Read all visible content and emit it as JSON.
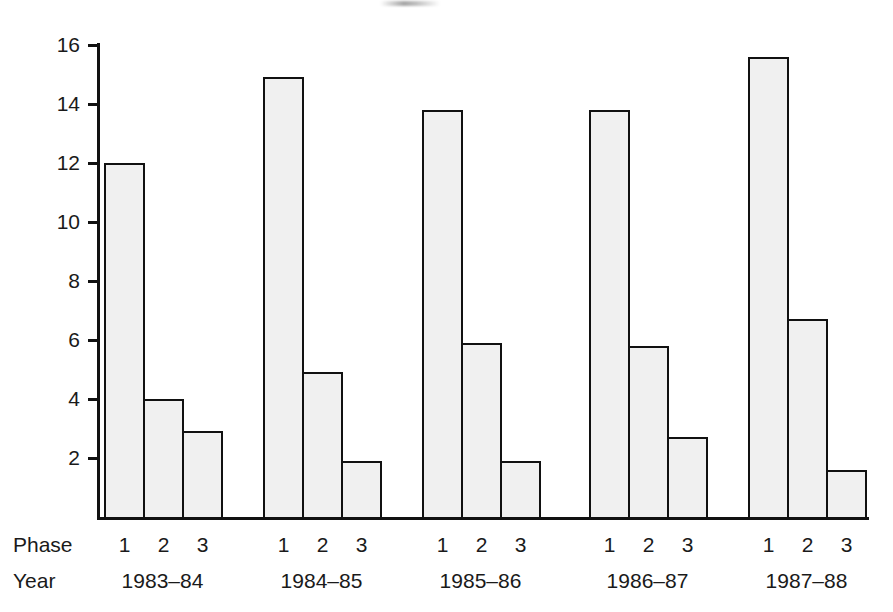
{
  "chart_data": {
    "type": "bar",
    "title": "",
    "xlabel": "",
    "ylabel": "",
    "ylim": [
      0,
      16
    ],
    "grid": false,
    "legend": null,
    "y_ticks": [
      2,
      4,
      6,
      8,
      10,
      12,
      14,
      16
    ],
    "axis_row_labels": {
      "phase": "Phase",
      "year": "Year"
    },
    "categories": [
      "1983-84",
      "1984-85",
      "1985-86",
      "1986-87",
      "1987-88"
    ],
    "phases": [
      "1",
      "2",
      "3"
    ],
    "series": [
      {
        "name": "Phase 1",
        "values": [
          12.0,
          14.9,
          13.8,
          13.8,
          15.6
        ]
      },
      {
        "name": "Phase 2",
        "values": [
          4.0,
          4.9,
          5.9,
          5.8,
          6.7
        ]
      },
      {
        "name": "Phase 3",
        "values": [
          2.9,
          1.9,
          1.9,
          2.7,
          1.6
        ]
      }
    ],
    "groups": [
      {
        "year": "1983-84",
        "bars": [
          {
            "phase": "1",
            "value": 12.0
          },
          {
            "phase": "2",
            "value": 4.0
          },
          {
            "phase": "3",
            "value": 2.9
          }
        ]
      },
      {
        "year": "1984-85",
        "bars": [
          {
            "phase": "1",
            "value": 14.9
          },
          {
            "phase": "2",
            "value": 4.9
          },
          {
            "phase": "3",
            "value": 1.9
          }
        ]
      },
      {
        "year": "1985-86",
        "bars": [
          {
            "phase": "1",
            "value": 13.8
          },
          {
            "phase": "2",
            "value": 5.9
          },
          {
            "phase": "3",
            "value": 1.9
          }
        ]
      },
      {
        "year": "1986-87",
        "bars": [
          {
            "phase": "1",
            "value": 13.8
          },
          {
            "phase": "2",
            "value": 5.8
          },
          {
            "phase": "3",
            "value": 2.7
          }
        ]
      },
      {
        "year": "1987-88",
        "bars": [
          {
            "phase": "1",
            "value": 15.6
          },
          {
            "phase": "2",
            "value": 6.7
          },
          {
            "phase": "3",
            "value": 1.6
          }
        ]
      }
    ],
    "colors": {
      "bar_fill": "#f0f0f0",
      "bar_stroke": "#111111",
      "axis": "#111111",
      "text": "#1a1a1a",
      "background": "#ffffff"
    }
  },
  "layout": {
    "baseline_y": 517,
    "px_per_unit": 29.5,
    "axis_x": 97,
    "group_x_starts": [
      104,
      263,
      422,
      589,
      748
    ],
    "bar_width": 39,
    "phase_label_y": 534,
    "year_label_y": 570
  }
}
